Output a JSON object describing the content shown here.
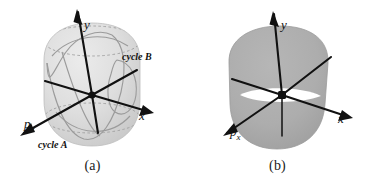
{
  "figure": {
    "type": "scientific-diagram",
    "background_color": "#ffffff",
    "ink_color": "#111111",
    "surface_fill_a": "#d8d8d8",
    "surface_fill_b": "#ababab",
    "curve_color": "#9a9a9a",
    "dashed_color": "#a8a8a8"
  },
  "panels": [
    {
      "id": "a",
      "caption": "(a)",
      "description": "Barrel-shaped surface with latitude dashed ellipses and two closed orbit curves",
      "axes": [
        {
          "name": "y",
          "label": "y"
        },
        {
          "name": "x",
          "label": "x"
        },
        {
          "name": "p_x",
          "label": "p",
          "subscript": "x"
        }
      ],
      "annotations": [
        {
          "name": "cycle-b",
          "label": "cycle B"
        },
        {
          "name": "cycle-a",
          "label": "cycle A"
        }
      ]
    },
    {
      "id": "b",
      "caption": "(b)",
      "description": "Solid shaded barrel-shaped surface with a white lens-shaped slit at the origin",
      "axes": [
        {
          "name": "y",
          "label": "y"
        },
        {
          "name": "x",
          "label": "x"
        },
        {
          "name": "p_x",
          "label": "p",
          "subscript": "x"
        }
      ],
      "annotations": []
    }
  ]
}
